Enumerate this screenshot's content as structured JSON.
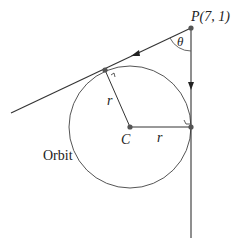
{
  "diagram": {
    "point_p": {
      "label": "P(7, 1)",
      "x": 191,
      "y": 28
    },
    "angle_label": "θ",
    "center": {
      "label": "C",
      "x": 130,
      "y": 127
    },
    "radius_px": 61,
    "radius_label_upper": "r",
    "radius_label_right": "r",
    "orbit_label": "Orbit",
    "tangent_point_left": {
      "x": 105,
      "y": 70
    },
    "tangent_point_right": {
      "x": 191,
      "y": 127
    },
    "colors": {
      "line": "#333333",
      "point": "#555555",
      "text": "#222222"
    }
  }
}
